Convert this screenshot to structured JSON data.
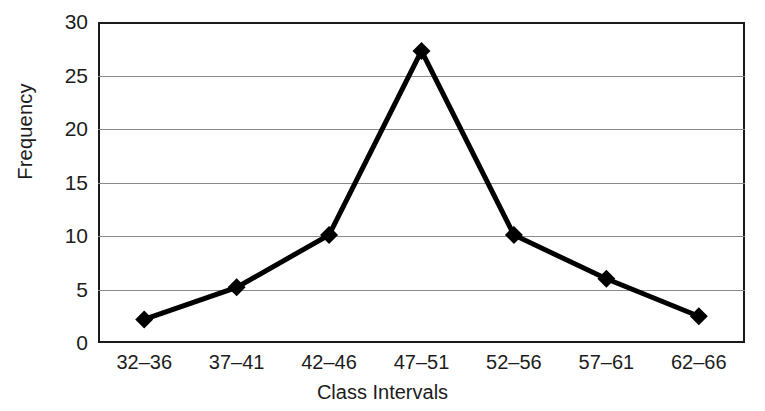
{
  "chart_data": {
    "type": "line",
    "title": "",
    "xlabel": "Class Intervals",
    "ylabel": "Frequency",
    "categories": [
      "32–36",
      "37–41",
      "42–46",
      "47–51",
      "52–56",
      "57–61",
      "62–66"
    ],
    "values": [
      2.2,
      5.2,
      10.1,
      27.3,
      10.1,
      6.0,
      2.5
    ],
    "series": [
      {
        "name": "Frequency",
        "values": [
          2.2,
          5.2,
          10.1,
          27.3,
          10.1,
          6.0,
          2.5
        ]
      }
    ],
    "ylim": [
      0,
      30
    ],
    "y_ticks": [
      0,
      5,
      10,
      15,
      20,
      25,
      30
    ],
    "y_tick_labels": [
      "0",
      "5",
      "10",
      "15",
      "20",
      "25",
      "30"
    ],
    "grid": true,
    "grid_axis": "y",
    "legend": "none",
    "marker": "diamond",
    "line_color": "#000000",
    "marker_color": "#000000",
    "grid_color": "#8a8a8a",
    "frame_color": "#1a1a1a",
    "background": "#ffffff"
  }
}
